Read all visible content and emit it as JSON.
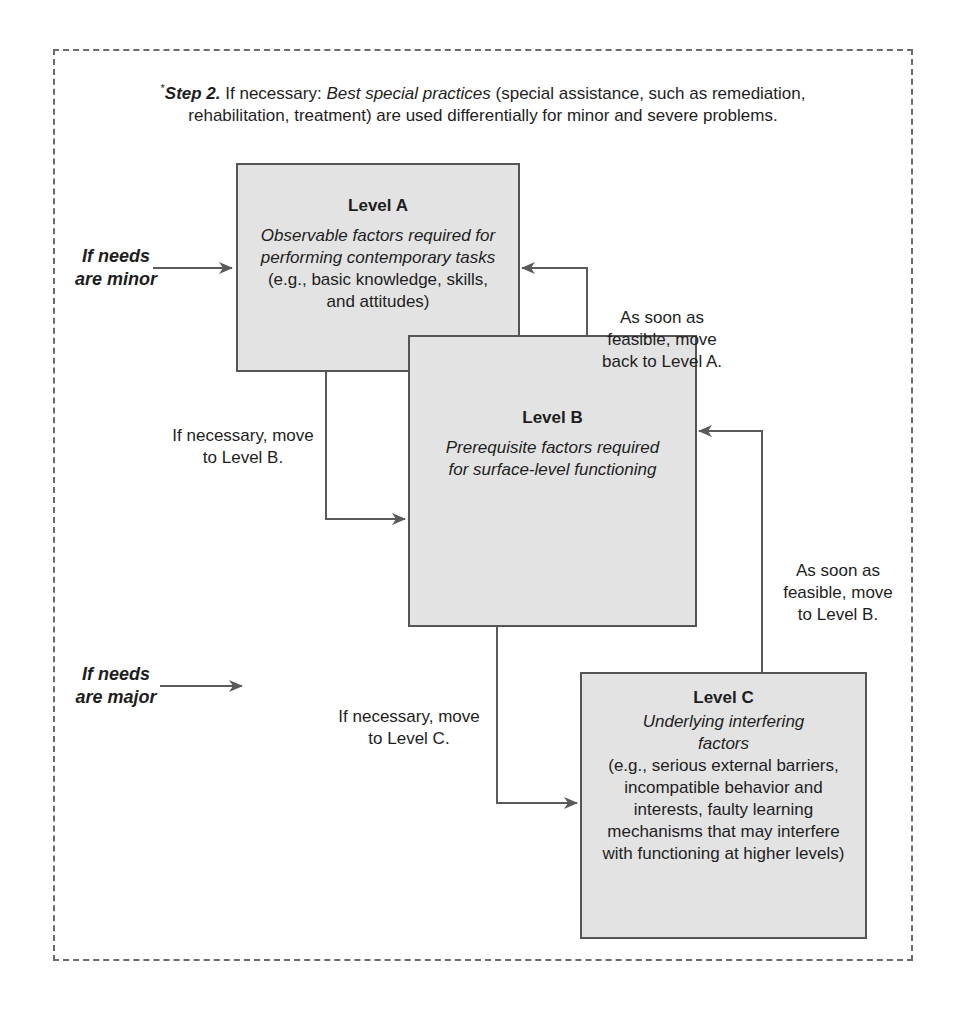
{
  "header": {
    "asterisk": "*",
    "step_label": "Step 2.",
    "prefix": " If necessary: ",
    "emphasis": "Best special practices",
    "rest": " (special assistance, such as remediation, rehabilitation, treatment) are used differentially for minor and severe problems."
  },
  "levels": [
    {
      "title": "Level A",
      "italic_text": "Observable factors required for performing contemporary tasks",
      "plain_text": " (e.g., basic knowledge, skills, and attitudes)"
    },
    {
      "title": "Level B",
      "italic_text": "Prerequisite factors required for surface-level functioning",
      "plain_text": ""
    },
    {
      "title": "Level C",
      "italic_text": "Underlying interfering factors",
      "plain_text": "(e.g., serious external barriers, incompatible behavior and interests, faulty learning mechanisms that may interfere with functioning at higher levels)"
    }
  ],
  "entry_labels": {
    "minor": "If needs are minor",
    "major": "If needs are major"
  },
  "transitions": {
    "a_to_b": "If necessary, move to Level B.",
    "b_to_a": "As soon as feasible, move back to Level A.",
    "b_to_c": "If necessary, move to Level C.",
    "c_to_b": "As soon as feasible, move to Level B."
  },
  "colors": {
    "box_fill": "#e3e3e3",
    "box_border": "#555555",
    "arrow": "#5a5a5a",
    "dashed_frame": "#6a6a6a"
  }
}
